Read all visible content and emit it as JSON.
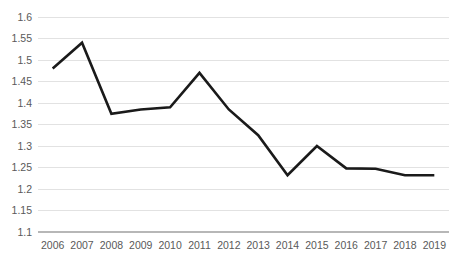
{
  "chart_data": {
    "type": "line",
    "title": "",
    "subtitle": "",
    "xlabel": "",
    "ylabel": "",
    "categories": [
      "2006",
      "2007",
      "2008",
      "2009",
      "2010",
      "2011",
      "2012",
      "2013",
      "2014",
      "2015",
      "2016",
      "2017",
      "2018",
      "2019"
    ],
    "x": [
      2006,
      2007,
      2008,
      2009,
      2010,
      2011,
      2012,
      2013,
      2014,
      2015,
      2016,
      2017,
      2018,
      2019
    ],
    "values": [
      1.48,
      1.54,
      1.375,
      1.385,
      1.39,
      1.47,
      1.385,
      1.325,
      1.232,
      1.3,
      1.248,
      1.247,
      1.232,
      1.232
    ],
    "series": [
      {
        "name": "series-1",
        "color": "#1a1a1a",
        "values": [
          1.48,
          1.54,
          1.375,
          1.385,
          1.39,
          1.47,
          1.385,
          1.325,
          1.232,
          1.3,
          1.248,
          1.247,
          1.232,
          1.232
        ]
      }
    ],
    "ylim": [
      1.1,
      1.6
    ],
    "yticks": [
      1.1,
      1.15,
      1.2,
      1.25,
      1.3,
      1.35,
      1.4,
      1.45,
      1.5,
      1.55,
      1.6
    ],
    "ytick_labels": [
      "1.1",
      "1.15",
      "1.2",
      "1.25",
      "1.3",
      "1.35",
      "1.4",
      "1.45",
      "1.5",
      "1.55",
      "1.6"
    ],
    "xtick_labels": [
      "2006",
      "2007",
      "2008",
      "2009",
      "2010",
      "2011",
      "2012",
      "2013",
      "2014",
      "2015",
      "2016",
      "2017",
      "2018",
      "2019"
    ],
    "grid": true,
    "grid_axis": "y",
    "grid_color": "#e2e2e2",
    "legend": false,
    "legend_position": "none",
    "markers": false,
    "axis_line_color": "#b7b7b7",
    "tick_label_color": "#595959",
    "background": "#ffffff",
    "annotations": []
  }
}
